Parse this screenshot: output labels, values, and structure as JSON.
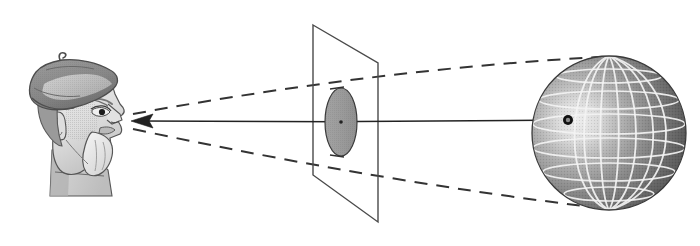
{
  "diagram": {
    "title": "Perspective projection of a sphere onto a picture plane",
    "background_color": "#ffffff",
    "width": 700,
    "height": 246,
    "caption": "",
    "elements": {
      "observer": {
        "label": "observer-head",
        "description": "Profile head of a bearded man wearing a large floppy beret, facing right",
        "eye_point": [
          131,
          121
        ],
        "bounds": [
          14,
          52,
          126,
          196
        ],
        "colors": {
          "outline": "#4a4a4a",
          "hat_dark": "#8d8d8d",
          "hat_mid": "#a8a8a8",
          "hat_light": "#d2d2d2",
          "skin_light": "#e6e6e6",
          "skin_mid": "#c4c4c4",
          "beard": "#efefef",
          "eye": "#222222"
        }
      },
      "picture_plane": {
        "label": "picture-plane",
        "description": "Transparent quadrilateral picture plane seen edge-on in oblique projection",
        "corners": [
          [
            313,
            25
          ],
          [
            378,
            63
          ],
          [
            378,
            222
          ],
          [
            313,
            175
          ]
        ],
        "stroke_color": "#4a4a4a",
        "stroke_width": 1.4,
        "fill": "none"
      },
      "projected_image": {
        "label": "projected-ellipse",
        "description": "Gray ellipse on the picture plane: the perspective image of the sphere",
        "center": [
          341,
          122
        ],
        "rx": 16,
        "ry": 34,
        "fill_color": "#9a9a9a",
        "stroke_color": "#3a3a3a"
      },
      "sphere": {
        "label": "target-sphere",
        "description": "Shaded wireframe globe with meridians and parallels, lit from the left",
        "center": [
          609,
          133
        ],
        "radius": 77,
        "shading": {
          "highlight_color": "#e2e2e2",
          "mid_color": "#8e8e8e",
          "shadow_color": "#4f4f4f",
          "highlight_position": [
            0.3,
            0.42
          ]
        },
        "grid": {
          "line_color": "#f2f2f2",
          "meridian_count": 7,
          "parallel_count": 7
        },
        "outline_color": "#3a3a3a"
      },
      "surface_point": {
        "label": "surface-point-marker",
        "description": "Small dark ring marking the point on the sphere struck by the central ray",
        "position": [
          568,
          120
        ],
        "outer_radius": 5,
        "inner_radius": 2.2,
        "fill_color": "#111111",
        "inner_color": "#8a8a8a"
      },
      "sight_ray": {
        "label": "central-sight-ray",
        "description": "Solid ray from the sphere surface point through the picture plane to the eye, arrowhead at the eye",
        "from": [
          568,
          120
        ],
        "to": [
          131,
          121
        ],
        "stroke_color": "#222222",
        "stroke_width": 1.5,
        "arrow_at": "eye",
        "arrow_length": 22,
        "arrow_half_width": 7
      },
      "projection_cone": {
        "label": "projection-cone-dashed-rays",
        "description": "Two dashed tangent rays forming the cone of vision from the eye to the silhouette of the sphere",
        "stroke_color": "#333333",
        "stroke_width": 2.0,
        "dash_pattern": "13 9",
        "upper_ray": {
          "label": "upper-tangent-ray",
          "start": [
            133,
            114
          ],
          "control": [
            380,
            69
          ],
          "end": [
            600,
            57
          ]
        },
        "lower_ray": {
          "label": "lower-tangent-ray",
          "start": [
            133,
            129
          ],
          "control": [
            382,
            182
          ],
          "end": [
            600,
            208
          ]
        }
      }
    }
  }
}
